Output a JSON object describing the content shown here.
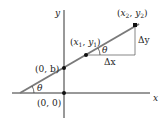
{
  "diagram": {
    "type": "slope-of-line",
    "axes": {
      "x_label": "x",
      "y_label": "y"
    },
    "points": [
      {
        "id": "origin",
        "label": "(0, 0)"
      },
      {
        "id": "y_intercept",
        "label": "(0, b)"
      },
      {
        "id": "p1",
        "label_prefix": "(",
        "label_x": "x",
        "label_x_sub": "1",
        "label_sep": ", ",
        "label_y": "y",
        "label_y_sub": "1",
        "label_suffix": ")"
      },
      {
        "id": "p2",
        "label_prefix": "(",
        "label_x": "x",
        "label_x_sub": "2",
        "label_sep": ", ",
        "label_y": "y",
        "label_y_sub": "2",
        "label_suffix": ")"
      }
    ],
    "delta_x": "Δx",
    "delta_y": "Δy",
    "angle_label": "θ",
    "colors": {
      "line": "#7a7a7a",
      "axis": "#333333",
      "point": "#111111",
      "triangle": "#555555"
    }
  }
}
